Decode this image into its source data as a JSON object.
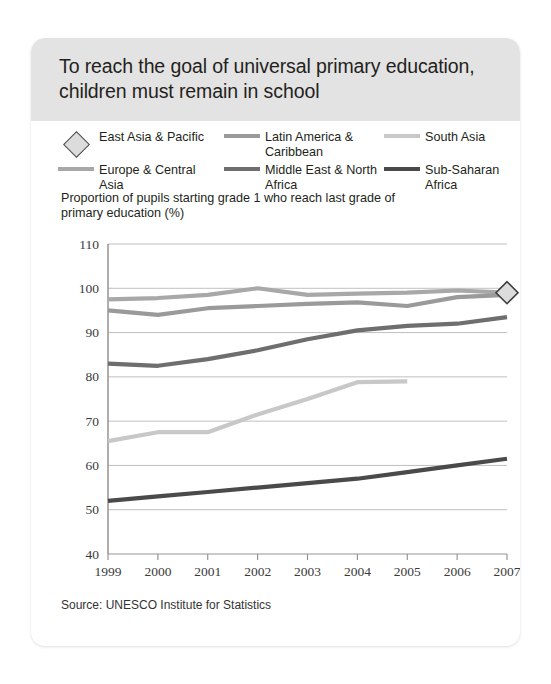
{
  "card": {
    "title": "To reach the goal of universal primary education, children must remain in school",
    "subtitle": "Proportion of pupils starting grade 1 who reach last grade of primary education (%)",
    "source": "Source: UNESCO Institute for Statistics"
  },
  "legend": {
    "position": "top",
    "items": [
      {
        "label": "East Asia & Pacific",
        "symbol": "diamond-marker",
        "color": "#dcdcdc"
      },
      {
        "label": "Latin America & Caribbean",
        "symbol": "line-swatch",
        "color": "#9a9a9a"
      },
      {
        "label": "South Asia",
        "symbol": "line-swatch",
        "color": "#c8c8c8"
      },
      {
        "label": "Europe & Central Asia",
        "symbol": "line-swatch",
        "color": "#a8a8a8"
      },
      {
        "label": "Middle East & North Africa",
        "symbol": "line-swatch",
        "color": "#6e6e6e"
      },
      {
        "label": "Sub-Saharan Africa",
        "symbol": "line-swatch",
        "color": "#4a4a4a"
      }
    ]
  },
  "chart_data": {
    "type": "line",
    "title": "To reach the goal of universal primary education, children must remain in school",
    "ylabel": "Proportion of pupils starting grade 1 who reach last grade of primary education (%)",
    "xlabel": "",
    "x": [
      1999,
      2000,
      2001,
      2002,
      2003,
      2004,
      2005,
      2006,
      2007
    ],
    "xticklabels": [
      "1999",
      "2000",
      "2001",
      "2002",
      "2003",
      "2004",
      "2005",
      "2006",
      "2007"
    ],
    "yticklabels": [
      "40",
      "50",
      "60",
      "70",
      "80",
      "90",
      "100",
      "110"
    ],
    "ylim": [
      40,
      110
    ],
    "ytick_step": 10,
    "grid": true,
    "legend_position": "top",
    "series": [
      {
        "name": "East Asia & Pacific",
        "color": "#a8a8a8",
        "marker": "diamond",
        "marker_at": [
          2007
        ],
        "values": [
          97.5,
          97.8,
          98.5,
          100.0,
          98.5,
          98.8,
          99.0,
          99.5,
          99.0
        ]
      },
      {
        "name": "Latin America & Caribbean",
        "color": "#9a9a9a",
        "values": [
          95.0,
          94.0,
          95.5,
          96.0,
          96.5,
          96.8,
          96.0,
          98.0,
          98.5
        ]
      },
      {
        "name": "Middle East & North Africa",
        "color": "#6e6e6e",
        "values": [
          83.0,
          82.5,
          84.0,
          86.0,
          88.5,
          90.5,
          91.5,
          92.0,
          93.5
        ]
      },
      {
        "name": "South Asia",
        "color": "#c8c8c8",
        "values": [
          65.5,
          67.5,
          67.5,
          71.5,
          75.0,
          78.8,
          79.0,
          null,
          null
        ]
      },
      {
        "name": "Sub-Saharan Africa",
        "color": "#4a4a4a",
        "values": [
          52.0,
          53.0,
          54.0,
          55.0,
          56.0,
          57.0,
          58.5,
          60.0,
          61.5
        ]
      }
    ]
  },
  "colors": {
    "header_bg": "#e3e3e3",
    "card_bg": "#ffffff",
    "text": "#231f20",
    "axis": "#8c8c8c",
    "grid": "#b8b8b8"
  }
}
